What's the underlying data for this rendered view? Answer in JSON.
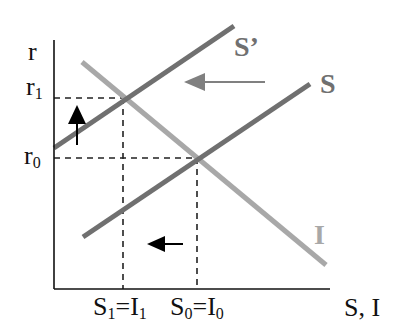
{
  "diagram": {
    "type": "loanable-funds-shift",
    "axes": {
      "y_label": "r",
      "x_label": "S, I",
      "origin": [
        54,
        289
      ],
      "y_top": 40,
      "x_right": 330,
      "color": "#111111"
    },
    "y_ticks": [
      {
        "base": "r",
        "sub": "1",
        "y": 98
      },
      {
        "base": "r",
        "sub": "0",
        "y": 158
      }
    ],
    "x_ticks": [
      {
        "text": "S₁=I₁",
        "parts": [
          {
            "b": "S",
            "s": "1"
          },
          {
            "b": "=I",
            "s": "1"
          }
        ],
        "x": 123
      },
      {
        "text": "S₀=I₀",
        "parts": [
          {
            "b": "S",
            "s": "0"
          },
          {
            "b": "=I",
            "s": "0"
          }
        ],
        "x": 197
      }
    ],
    "curves": [
      {
        "name": "S'",
        "label": "S’",
        "from": [
          54,
          148
        ],
        "to": [
          234,
          26
        ],
        "color": "#707070",
        "label_pos": [
          234,
          56
        ]
      },
      {
        "name": "S",
        "label": "S",
        "from": [
          83,
          237
        ],
        "to": [
          310,
          84
        ],
        "color": "#707070",
        "label_pos": [
          320,
          93
        ]
      },
      {
        "name": "I",
        "label": "I",
        "from": [
          82,
          62
        ],
        "to": [
          326,
          265
        ],
        "color": "#a8a8a8",
        "label_pos": [
          314,
          244
        ]
      }
    ],
    "guides": [
      {
        "name": "r1-guide",
        "h": [
          54,
          123,
          98
        ],
        "v": [
          123,
          98,
          289
        ]
      },
      {
        "name": "r0-guide",
        "h": [
          54,
          197,
          158
        ],
        "v": [
          197,
          158,
          289
        ]
      }
    ],
    "arrows": [
      {
        "name": "supply-shift-arrow",
        "direction": "left",
        "from": [
          265,
          82
        ],
        "to": [
          184,
          82
        ],
        "color": "#808080"
      },
      {
        "name": "rate-up-arrow",
        "direction": "up",
        "from": [
          77,
          145
        ],
        "to": [
          77,
          105
        ],
        "color": "#000000"
      },
      {
        "name": "quantity-down-arrow",
        "direction": "left",
        "from": [
          183,
          244
        ],
        "to": [
          147,
          244
        ],
        "color": "#000000"
      }
    ]
  },
  "labels": {
    "y_axis": "r",
    "x_axis": "S, I",
    "r1_base": "r",
    "r1_sub": "1",
    "r0_base": "r",
    "r0_sub": "0",
    "s1_base": "S",
    "s1_sub": "1",
    "i1_base": "=I",
    "i1_sub": "1",
    "s0_base": "S",
    "s0_sub": "0",
    "i0_base": "=I",
    "i0_sub": "0",
    "curve_s_prime": "S’",
    "curve_s": "S",
    "curve_i": "I"
  },
  "colors": {
    "supply": "#707070",
    "investment": "#a8a8a8",
    "axis": "#111111",
    "guide": "#222222",
    "shift_arrow": "#808080",
    "black_arrow": "#000000"
  }
}
